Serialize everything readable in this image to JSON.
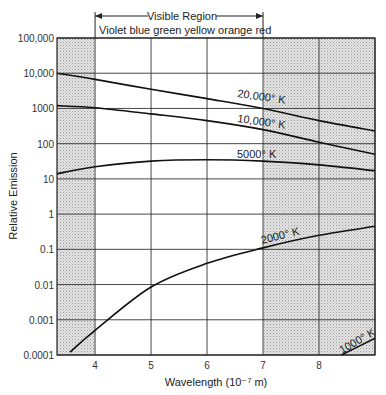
{
  "chart_data": {
    "type": "line",
    "title": "",
    "header": {
      "region_label": "Visible Region",
      "colors_label": "Violet blue green yellow  orange red"
    },
    "xlabel": "Wavelength (10⁻⁷ m)",
    "ylabel": "Relative Emission",
    "xlim": [
      3.32,
      9.0
    ],
    "ylim": [
      0.0001,
      100000
    ],
    "yscale": "log",
    "x_ticks": [
      "4",
      "5",
      "6",
      "7",
      "8"
    ],
    "y_ticks": [
      "100,000",
      "10,000",
      "1000",
      "100",
      "10",
      "1",
      "0.1",
      "0.01",
      "0.001",
      "0.0001"
    ],
    "grid": true,
    "shaded_regions": [
      [
        3.32,
        4.0
      ],
      [
        7.0,
        9.0
      ]
    ],
    "visible_region": [
      4.0,
      7.0
    ],
    "series": [
      {
        "name": "20,000° K",
        "x": [
          3.32,
          4,
          5,
          6,
          7,
          8,
          9
        ],
        "values": [
          10000,
          6700,
          3500,
          1900,
          1000,
          450,
          230
        ]
      },
      {
        "name": "10,000° K",
        "x": [
          3.32,
          4,
          5,
          6,
          7,
          8,
          9
        ],
        "values": [
          1200,
          1050,
          700,
          450,
          250,
          110,
          50
        ]
      },
      {
        "name": "5000° K",
        "x": [
          3.32,
          4,
          5,
          6,
          7,
          8,
          9
        ],
        "values": [
          14,
          22,
          32,
          35,
          32,
          25,
          17
        ]
      },
      {
        "name": "2000° K",
        "x": [
          3.55,
          4,
          5,
          6,
          7,
          8,
          9
        ],
        "values": [
          0.00012,
          0.0005,
          0.0085,
          0.04,
          0.11,
          0.25,
          0.45
        ]
      },
      {
        "name": "1000° K",
        "x": [
          8.4,
          9
        ],
        "values": [
          0.0001,
          0.0003
        ]
      }
    ]
  }
}
